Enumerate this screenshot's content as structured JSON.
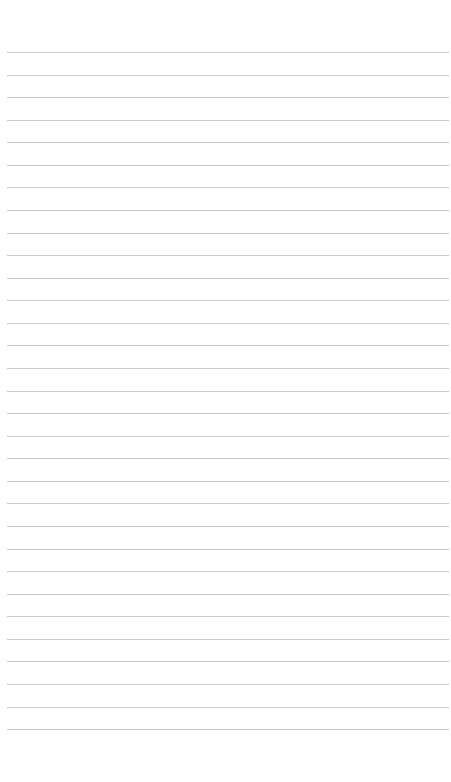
{
  "page": {
    "type": "lined-paper",
    "background_color": "#ffffff",
    "line_color": "#c9c9c9",
    "line_count": 31,
    "first_line_y": 52,
    "line_spacing": 22.57,
    "line_left": 7,
    "line_right": 449
  }
}
